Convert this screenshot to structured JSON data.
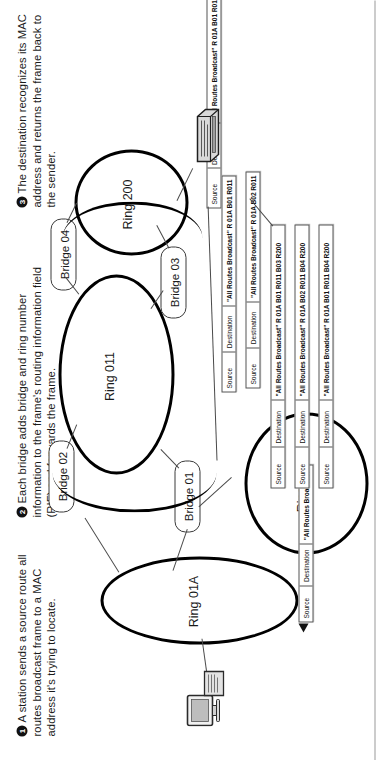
{
  "figure": {
    "orientation": "rotated-90-ccw"
  },
  "steps": [
    {
      "number": "1",
      "text": "A station sends a source route all routes broadcast frame to a MAC address it's trying to locate."
    },
    {
      "number": "2",
      "text": "Each bridge adds bridge and ring number information to the frame's routing information field (RIF) and forwards the frame."
    },
    {
      "number": "3",
      "text": "The destination recognizes its MAC address and returns the frame back to the sender."
    }
  ],
  "rings": [
    {
      "id": "ring-01a",
      "label": "Ring 01A"
    },
    {
      "id": "ring-01b",
      "label": "Ring 01B"
    },
    {
      "id": "ring-011",
      "label": "Ring 011"
    },
    {
      "id": "ring-200",
      "label": "Ring 200"
    }
  ],
  "bridges": [
    {
      "id": "bridge-01",
      "label": "Bridge 01"
    },
    {
      "id": "bridge-02",
      "label": "Bridge 02"
    },
    {
      "id": "bridge-03",
      "label": "Bridge 03"
    },
    {
      "id": "bridge-04",
      "label": "Bridge 04"
    }
  ],
  "frame_fields": {
    "source": "Source",
    "destination": "Destination"
  },
  "frames": [
    {
      "id": "frame-initial",
      "source": "Source",
      "destination": "Destination",
      "rif": "\"All Routes Broadcast\""
    },
    {
      "id": "frame-b01-r01b",
      "source": "Source",
      "destination": "Destination",
      "rif": "\"All Routes Broadcast\" R 01A B01 R01B"
    },
    {
      "id": "frame-b01-r011",
      "source": "Source",
      "destination": "Destination",
      "rif": "\"All Routes Broadcast\" R 01A B01 R011"
    },
    {
      "id": "frame-b02-r011",
      "source": "Source",
      "destination": "Destination",
      "rif": "\"All Routes Broadcast\" R 01A B02 R011"
    },
    {
      "id": "frame-b01-r011-b03-r200",
      "source": "Source",
      "destination": "Destination",
      "rif": "\"All Routes Broadcast\" R 01A B01 R011 B03 R200"
    },
    {
      "id": "frame-b02-r011-b04-r200",
      "source": "Source",
      "destination": "Destination",
      "rif": "\"All Routes Broadcast\" R 01A B02 R011 B04 R200"
    },
    {
      "id": "frame-b01-r011-b04-r200",
      "source": "Source",
      "destination": "Destination",
      "rif": "\"All Routes Broadcast\" R 01A B01 R011 B04 R200"
    }
  ],
  "stations": [
    {
      "id": "source-station",
      "role": "sending station"
    },
    {
      "id": "destination-station",
      "role": "destination station"
    }
  ],
  "colors": {
    "ink": "#1a1a1a",
    "ring_stroke": "#000000",
    "frame_border": "#555555",
    "connector": "#4a4a4a",
    "page": "#ffffff"
  }
}
